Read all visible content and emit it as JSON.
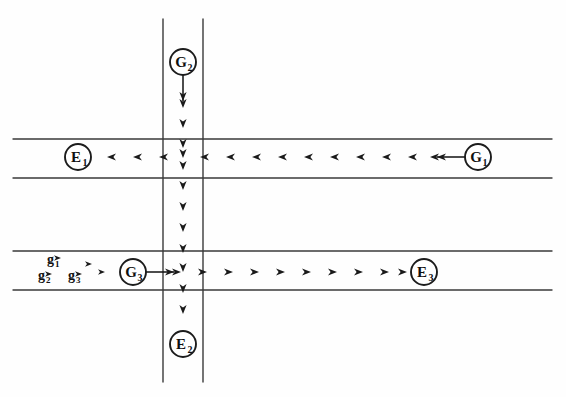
{
  "figure": {
    "background_color": "#fefefe",
    "line_color": "#3a3a3a",
    "ink_color": "#101010",
    "width": 566,
    "height": 397
  },
  "corridors": {
    "vertical": {
      "name": "vertical-corridor",
      "left_edge_x": 163,
      "right_edge_x": 203,
      "top_y": 19,
      "bottom_y": 382,
      "flow_direction": "down",
      "flow_axis_x": 183
    },
    "horizontal_upper": {
      "name": "upper-horizontal-corridor",
      "top_edge_y": 139,
      "bottom_edge_y": 178,
      "left_x": 13,
      "right_x": 552,
      "flow_direction": "left",
      "flow_axis_y": 157
    },
    "horizontal_lower": {
      "name": "lower-horizontal-corridor",
      "top_edge_y": 251,
      "bottom_edge_y": 290,
      "left_x": 13,
      "right_x": 552,
      "flow_direction": "right",
      "flow_axis_y": 272
    }
  },
  "nodes": [
    {
      "id": "G2",
      "letter": "G",
      "subscript": "2",
      "role": "source",
      "cx": 183,
      "cy": 62,
      "r": 13,
      "stem": {
        "from_x": 183,
        "from_y": 75,
        "to_x": 183,
        "to_y": 101,
        "direction": "down"
      }
    },
    {
      "id": "G1",
      "letter": "G",
      "subscript": "1",
      "role": "source",
      "cx": 478,
      "cy": 157,
      "r": 13,
      "stem": {
        "from_x": 465,
        "from_y": 157,
        "to_x": 437,
        "to_y": 157,
        "direction": "left"
      }
    },
    {
      "id": "G3",
      "letter": "G",
      "subscript": "3",
      "role": "source",
      "cx": 133,
      "cy": 272,
      "r": 13,
      "stem": {
        "from_x": 146,
        "from_y": 272,
        "to_x": 174,
        "to_y": 272,
        "direction": "right"
      }
    },
    {
      "id": "E1",
      "letter": "E",
      "subscript": "1",
      "role": "exit",
      "cx": 78,
      "cy": 157,
      "r": 13,
      "stem": null
    },
    {
      "id": "E2",
      "letter": "E",
      "subscript": "2",
      "role": "exit",
      "cx": 183,
      "cy": 344,
      "r": 13,
      "stem": null
    },
    {
      "id": "E3",
      "letter": "E",
      "subscript": "3",
      "role": "exit",
      "cx": 424,
      "cy": 272,
      "r": 13,
      "stem": null
    }
  ],
  "flow_markers": {
    "vertical_down": {
      "name": "downward-flow-arrowheads",
      "axis_x": 183,
      "direction": "down",
      "y_positions": [
        108,
        128,
        148,
        158,
        170,
        190,
        211,
        232,
        253,
        272,
        293,
        314
      ]
    },
    "upper_left": {
      "name": "leftward-flow-arrowheads",
      "axis_y": 157,
      "direction": "left",
      "x_positions": [
        107,
        133,
        159,
        200,
        226,
        252,
        278,
        304,
        330,
        356,
        382,
        408,
        430
      ]
    },
    "lower_right": {
      "name": "rightward-flow-arrowheads",
      "axis_y": 272,
      "direction": "right",
      "x_positions": [
        181,
        207,
        233,
        259,
        285,
        311,
        337,
        363,
        389,
        407
      ]
    }
  },
  "gas_labels": [
    {
      "id": "g1",
      "letter": "g",
      "subscript": "1",
      "x": 47,
      "y": 259,
      "tick_x": 61,
      "tick_y": 258
    },
    {
      "id": "g2",
      "letter": "g",
      "subscript": "2",
      "x": 38,
      "y": 275,
      "tick_x": 52,
      "tick_y": 274
    },
    {
      "id": "g3",
      "letter": "g",
      "subscript": "3",
      "x": 68,
      "y": 275,
      "tick_x": 82,
      "tick_y": 274
    },
    {
      "id": "g-extra-1",
      "letter": "",
      "subscript": "",
      "x": 0,
      "y": 0,
      "tick_x": 92,
      "tick_y": 264
    },
    {
      "id": "g-extra-2",
      "letter": "",
      "subscript": "",
      "x": 0,
      "y": 0,
      "tick_x": 105,
      "tick_y": 272
    }
  ]
}
